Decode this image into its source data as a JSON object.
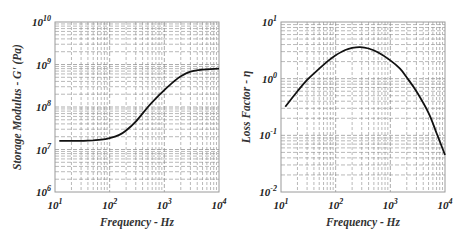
{
  "chart_data": [
    {
      "type": "line",
      "title": "",
      "xlabel": "Frequency - Hz",
      "ylabel": "Storage Modulus - G' (Pa)",
      "xscale": "log",
      "yscale": "log",
      "xlim": [
        10,
        10000
      ],
      "ylim": [
        1000000,
        10000000000
      ],
      "x_ticks": [
        "10^1",
        "10^2",
        "10^3",
        "10^4"
      ],
      "y_ticks": [
        "10^6",
        "10^7",
        "10^8",
        "10^9",
        "10^10"
      ],
      "grid": true,
      "grid_style": "dashed, major and minor log grid",
      "legend": null,
      "series": [
        {
          "name": "G'",
          "x": [
            12,
            20,
            30,
            50,
            70,
            100,
            150,
            200,
            300,
            500,
            700,
            1000,
            1500,
            2000,
            3000,
            5000,
            10000
          ],
          "y": [
            16000000,
            16000000,
            16000000,
            16500000,
            17000000,
            18500000,
            22000000,
            28000000,
            45000000,
            100000000,
            160000000,
            250000000,
            400000000,
            530000000,
            680000000,
            760000000,
            800000000
          ]
        }
      ]
    },
    {
      "type": "line",
      "title": "",
      "xlabel": "Frequency - Hz",
      "ylabel": "Loss Factor - η",
      "xscale": "log",
      "yscale": "log",
      "xlim": [
        10,
        10000
      ],
      "ylim": [
        0.01,
        10
      ],
      "x_ticks": [
        "10^1",
        "10^2",
        "10^3",
        "10^4"
      ],
      "y_ticks": [
        "10^-2",
        "10^-1",
        "10^0",
        "10^1"
      ],
      "grid": true,
      "grid_style": "dashed, major and minor log grid",
      "legend": null,
      "series": [
        {
          "name": "η",
          "x": [
            12,
            20,
            30,
            50,
            70,
            100,
            150,
            200,
            280,
            400,
            600,
            1000,
            1500,
            2000,
            3000,
            5000,
            7000,
            10000
          ],
          "y": [
            0.32,
            0.6,
            0.95,
            1.5,
            2.0,
            2.6,
            3.2,
            3.5,
            3.6,
            3.4,
            2.9,
            2.1,
            1.5,
            1.05,
            0.6,
            0.25,
            0.11,
            0.045
          ]
        }
      ]
    }
  ],
  "panels": [
    {
      "ylabel": "Storage Modulus - G' (Pa)",
      "xlabel": "Frequency - Hz",
      "x_tick_labels": [
        {
          "base": "10",
          "exp": "1"
        },
        {
          "base": "10",
          "exp": "2"
        },
        {
          "base": "10",
          "exp": "3"
        },
        {
          "base": "10",
          "exp": "4"
        }
      ],
      "y_tick_labels": [
        {
          "base": "10",
          "exp": "10"
        },
        {
          "base": "10",
          "exp": "9"
        },
        {
          "base": "10",
          "exp": "8"
        },
        {
          "base": "10",
          "exp": "7"
        },
        {
          "base": "10",
          "exp": "6"
        }
      ]
    },
    {
      "ylabel": "Loss Factor - η",
      "xlabel": "Frequency - Hz",
      "x_tick_labels": [
        {
          "base": "10",
          "exp": "1"
        },
        {
          "base": "10",
          "exp": "2"
        },
        {
          "base": "10",
          "exp": "3"
        },
        {
          "base": "10",
          "exp": "4"
        }
      ],
      "y_tick_labels": [
        {
          "base": "10",
          "exp": "1"
        },
        {
          "base": "10",
          "exp": "0"
        },
        {
          "base": "10",
          "exp": "-1"
        },
        {
          "base": "10",
          "exp": "-2"
        }
      ]
    }
  ],
  "colors": {
    "curve": "#111111",
    "grid": "#8a8a8a",
    "frame": "#9a9a9a",
    "text": "#222222"
  }
}
